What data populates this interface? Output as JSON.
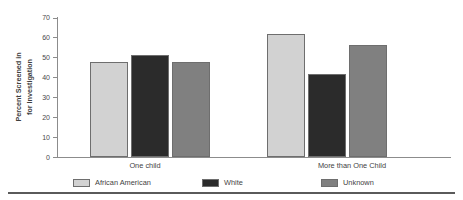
{
  "chart_data": {
    "type": "bar",
    "title": "",
    "xlabel": "",
    "ylabel": "Percent Screened in for Investigation",
    "ylabel_line1": "Percent Screened in",
    "ylabel_line2": "for Investigation",
    "ylim": [
      0,
      70
    ],
    "ytick_step": 10,
    "yticks": [
      70,
      60,
      50,
      40,
      30,
      20,
      10,
      0
    ],
    "ytick_labels": [
      "70",
      "60",
      "50",
      "40",
      "30",
      "20",
      "10",
      "0"
    ],
    "grid": false,
    "legend_position": "bottom",
    "categories": [
      "One child",
      "More than One Child"
    ],
    "series": [
      {
        "name": "African American",
        "color": "#d2d2d2",
        "values": [
          48,
          62
        ]
      },
      {
        "name": "White",
        "color": "#2b2b2b",
        "values": [
          51.5,
          42
        ]
      },
      {
        "name": "Unknown",
        "color": "#808080",
        "values": [
          48,
          56.5
        ]
      }
    ]
  },
  "axis": {
    "y_label_line1": "Percent Screened in",
    "y_label_line2": "for Investigation",
    "tick_70": "70",
    "tick_60": "60",
    "tick_50": "50",
    "tick_40": "40",
    "tick_30": "30",
    "tick_20": "20",
    "tick_10": "10",
    "tick_0": "0"
  },
  "groups": {
    "g1": "One child",
    "g2": "More than One Child"
  },
  "legend": {
    "item1": "African American",
    "item2": "White",
    "item3": "Unknown"
  },
  "colors": {
    "african_american": "#d2d2d2",
    "white": "#2b2b2b",
    "unknown": "#808080",
    "axis": "#8c8c8c",
    "rule": "#5a5a5a",
    "text": "#3f3f3f"
  }
}
